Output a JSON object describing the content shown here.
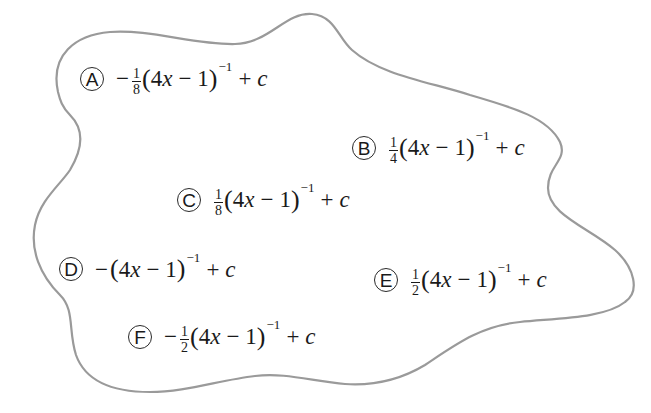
{
  "diagram": {
    "type": "answer-choices-blob",
    "outline_color": "#9a9a9a",
    "text_color": "#1a1a1a"
  },
  "options": [
    {
      "label": "A",
      "sign": "−",
      "frac_num": "1",
      "frac_den": "8",
      "inner_coef": "4",
      "inner_var": "x",
      "inner_op": "−",
      "inner_const": "1",
      "exponent": "−1",
      "plus": "+",
      "constant": "c"
    },
    {
      "label": "B",
      "sign": "",
      "frac_num": "1",
      "frac_den": "4",
      "inner_coef": "4",
      "inner_var": "x",
      "inner_op": "−",
      "inner_const": "1",
      "exponent": "−1",
      "plus": "+",
      "constant": "c"
    },
    {
      "label": "C",
      "sign": "",
      "frac_num": "1",
      "frac_den": "8",
      "inner_coef": "4",
      "inner_var": "x",
      "inner_op": "−",
      "inner_const": "1",
      "exponent": "−1",
      "plus": "+",
      "constant": "c"
    },
    {
      "label": "D",
      "sign": "−",
      "frac_num": "",
      "frac_den": "",
      "inner_coef": "4",
      "inner_var": "x",
      "inner_op": "−",
      "inner_const": "1",
      "exponent": "−1",
      "plus": "+",
      "constant": "c"
    },
    {
      "label": "E",
      "sign": "",
      "frac_num": "1",
      "frac_den": "2",
      "inner_coef": "4",
      "inner_var": "x",
      "inner_op": "−",
      "inner_const": "1",
      "exponent": "−1",
      "plus": "+",
      "constant": "c"
    },
    {
      "label": "F",
      "sign": "−",
      "frac_num": "1",
      "frac_den": "2",
      "inner_coef": "4",
      "inner_var": "x",
      "inner_op": "−",
      "inner_const": "1",
      "exponent": "−1",
      "plus": "+",
      "constant": "c"
    }
  ],
  "options_text": [
    "A: −1/8(4x − 1)^−1 + c",
    "B: 1/4(4x − 1)^−1 + c",
    "C: 1/8(4x − 1)^−1 + c",
    "D: −(4x − 1)^−1 + c",
    "E: 1/2(4x − 1)^−1 + c",
    "F: −1/2(4x − 1)^−1 + c"
  ]
}
